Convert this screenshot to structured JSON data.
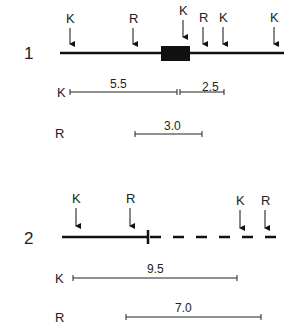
{
  "diagram": {
    "map1": {
      "number": "1",
      "sites": [
        {
          "label": "K",
          "x": 70
        },
        {
          "label": "R",
          "x": 133
        },
        {
          "label": "K",
          "x": 183
        },
        {
          "label": "R",
          "x": 203
        },
        {
          "label": "K",
          "x": 223
        },
        {
          "label": "K",
          "x": 274
        }
      ],
      "k_row_label": "K",
      "k_distances": [
        "5.5",
        "2.5"
      ],
      "r_row_label": "R",
      "r_distances": [
        "3.0"
      ]
    },
    "map2": {
      "number": "2",
      "sites": [
        {
          "label": "K",
          "x": 76
        },
        {
          "label": "R",
          "x": 130
        },
        {
          "label": "K",
          "x": 240
        },
        {
          "label": "R",
          "x": 265
        }
      ],
      "k_row_label": "K",
      "k_distances": [
        "9.5"
      ],
      "r_row_label": "R",
      "r_distances": [
        "7.0"
      ]
    }
  }
}
